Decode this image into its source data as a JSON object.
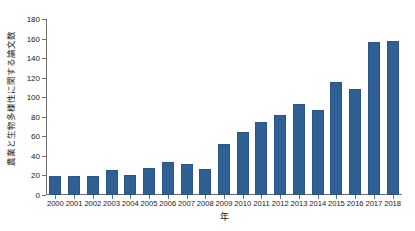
{
  "chart_data": {
    "type": "bar",
    "title": "",
    "xlabel": "年",
    "ylabel": "農業と生物多様性に関する論文数",
    "categories": [
      "2000",
      "2001",
      "2002",
      "2003",
      "2004",
      "2005",
      "2006",
      "2007",
      "2008",
      "2009",
      "2010",
      "2011",
      "2012",
      "2013",
      "2014",
      "2015",
      "2016",
      "2017",
      "2018"
    ],
    "values": [
      19,
      19,
      19,
      26,
      20,
      28,
      34,
      32,
      27,
      52,
      64,
      75,
      82,
      93,
      87,
      116,
      108,
      156,
      158
    ],
    "ylim": [
      0,
      180
    ],
    "ytick_labels": [
      "0",
      "20",
      "40",
      "60",
      "80",
      "100",
      "120",
      "140",
      "160",
      "180"
    ],
    "ytick_values": [
      0,
      20,
      40,
      60,
      80,
      100,
      120,
      140,
      160,
      180
    ],
    "xlim_categories": 19,
    "grid": false,
    "legend": null,
    "series": [
      {
        "name": "農業と生物多様性に関する論文数",
        "values": [
          19,
          19,
          19,
          26,
          20,
          28,
          34,
          32,
          27,
          52,
          64,
          75,
          82,
          93,
          87,
          116,
          108,
          156,
          158
        ]
      }
    ]
  },
  "colors": {
    "bar": "#2e6094",
    "bar_edge": "#2a5687",
    "axis": "#6f6f6f",
    "text": "#1a1a1a",
    "background": "#ffffff"
  }
}
